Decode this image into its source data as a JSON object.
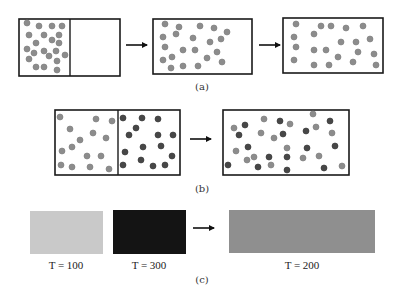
{
  "colors": {
    "border": "#1a1a1a",
    "dot_gray": "#8c8c8c",
    "dot_gray_stroke": "#7a7a7a",
    "dot_dark": "#474747",
    "dot_dark_stroke": "#333333",
    "arrow": "#111111",
    "rect_cold": "#c9c9c9",
    "rect_hot": "#141414",
    "rect_mixed": "#8f8f8f"
  },
  "dot_radius": 3,
  "panels": {
    "a": {
      "label": "(a)",
      "label_pos": [
        202,
        90
      ],
      "boxes": [
        {
          "name": "box-a-initial",
          "x": 19,
          "y": 19,
          "w": 101,
          "h": 57,
          "divider_x": 70,
          "gray_dots": [
            [
              27,
              23
            ],
            [
              39,
              26
            ],
            [
              52,
              26
            ],
            [
              62,
              26
            ],
            [
              29,
              35
            ],
            [
              44,
              35
            ],
            [
              59,
              35
            ],
            [
              36,
              43
            ],
            [
              52,
              40
            ],
            [
              59,
              43
            ],
            [
              27,
              49
            ],
            [
              34,
              53
            ],
            [
              44,
              51
            ],
            [
              56,
              51
            ],
            [
              65,
              55
            ],
            [
              29,
              59
            ],
            [
              49,
              56
            ],
            [
              57,
              61
            ],
            [
              36,
              67
            ],
            [
              44,
              67
            ],
            [
              57,
              70
            ]
          ],
          "dark_dots": []
        },
        {
          "name": "box-a-expanding",
          "x": 153,
          "y": 19,
          "w": 99,
          "h": 55,
          "divider_x": null,
          "gray_dots": [
            [
              165,
              24
            ],
            [
              179,
              27
            ],
            [
              200,
              26
            ],
            [
              214,
              28
            ],
            [
              227,
              32
            ],
            [
              163,
              37
            ],
            [
              176,
              34
            ],
            [
              193,
              38
            ],
            [
              210,
              42
            ],
            [
              221,
              39
            ],
            [
              165,
              47
            ],
            [
              183,
              50
            ],
            [
              195,
              50
            ],
            [
              217,
              52
            ],
            [
              163,
              60
            ],
            [
              172,
              57
            ],
            [
              207,
              58
            ],
            [
              222,
              62
            ],
            [
              171,
              68
            ],
            [
              183,
              66
            ],
            [
              198,
              66
            ]
          ],
          "dark_dots": []
        },
        {
          "name": "box-a-final",
          "x": 283,
          "y": 18,
          "w": 100,
          "h": 55,
          "divider_x": null,
          "gray_dots": [
            [
              296,
              24
            ],
            [
              321,
              26
            ],
            [
              331,
              26
            ],
            [
              346,
              28
            ],
            [
              363,
              26
            ],
            [
              294,
              37
            ],
            [
              314,
              34
            ],
            [
              341,
              42
            ],
            [
              356,
              42
            ],
            [
              370,
              39
            ],
            [
              296,
              47
            ],
            [
              314,
              50
            ],
            [
              326,
              50
            ],
            [
              358,
              52
            ],
            [
              294,
              60
            ],
            [
              338,
              57
            ],
            [
              353,
              62
            ],
            [
              374,
              54
            ],
            [
              314,
              65
            ],
            [
              329,
              65
            ],
            [
              376,
              65
            ]
          ],
          "dark_dots": []
        }
      ],
      "arrows": [
        {
          "x1": 126,
          "x2": 147,
          "y": 45
        },
        {
          "x1": 259,
          "x2": 280,
          "y": 45
        }
      ]
    },
    "b": {
      "label": "(b)",
      "label_pos": [
        202,
        192
      ],
      "boxes": [
        {
          "name": "box-b-initial",
          "x": 55,
          "y": 110,
          "w": 125,
          "h": 65,
          "divider_x": 118,
          "gray_dots": [
            [
              60,
              117
            ],
            [
              96,
              119
            ],
            [
              112,
              121
            ],
            [
              70,
              129
            ],
            [
              93,
              133
            ],
            [
              80,
              140
            ],
            [
              106,
              138
            ],
            [
              62,
              151
            ],
            [
              72,
              147
            ],
            [
              87,
              156
            ],
            [
              101,
              156
            ],
            [
              61,
              165
            ],
            [
              72,
              167
            ],
            [
              90,
              167
            ],
            [
              109,
              169
            ]
          ],
          "dark_dots": [
            [
              123,
              118
            ],
            [
              142,
              118
            ],
            [
              158,
              119
            ],
            [
              136,
              128
            ],
            [
              129,
              135
            ],
            [
              158,
              135
            ],
            [
              173,
              135
            ],
            [
              143,
              147
            ],
            [
              161,
              146
            ],
            [
              125,
              152
            ],
            [
              141,
              160
            ],
            [
              172,
              156
            ],
            [
              123,
              165
            ],
            [
              153,
              166
            ],
            [
              165,
              165
            ]
          ]
        },
        {
          "name": "box-b-mixed",
          "x": 223,
          "y": 110,
          "w": 126,
          "h": 65,
          "divider_x": null,
          "gray_dots": [
            [
              234,
              128
            ],
            [
              264,
              119
            ],
            [
              261,
              133
            ],
            [
              290,
              124
            ],
            [
              313,
              114
            ],
            [
              316,
              127
            ],
            [
              332,
              133
            ],
            [
              236,
              151
            ],
            [
              247,
              160
            ],
            [
              254,
              157
            ],
            [
              287,
              148
            ],
            [
              271,
              165
            ],
            [
              303,
              158
            ],
            [
              319,
              156
            ],
            [
              342,
              166
            ],
            [
              274,
              138
            ]
          ],
          "dark_dots": [
            [
              245,
              125
            ],
            [
              239,
              135
            ],
            [
              280,
              121
            ],
            [
              283,
              134
            ],
            [
              306,
              131
            ],
            [
              330,
              121
            ],
            [
              248,
              147
            ],
            [
              269,
              157
            ],
            [
              287,
              157
            ],
            [
              307,
              148
            ],
            [
              335,
              146
            ],
            [
              228,
              165
            ],
            [
              258,
              167
            ],
            [
              287,
              170
            ],
            [
              324,
              168
            ]
          ]
        }
      ],
      "arrows": [
        {
          "x1": 190,
          "x2": 211,
          "y": 139
        }
      ]
    },
    "c": {
      "label": "(c)",
      "label_pos": [
        202,
        283
      ],
      "rects": [
        {
          "name": "rect-cold",
          "x": 30,
          "y": 211,
          "w": 73,
          "h": 43,
          "fill_key": "rect_cold",
          "temp_label": "T = 100",
          "label_x": 66,
          "label_y": 269
        },
        {
          "name": "rect-hot",
          "x": 113,
          "y": 210,
          "w": 73,
          "h": 44,
          "fill_key": "rect_hot",
          "temp_label": "T = 300",
          "label_x": 149,
          "label_y": 269
        },
        {
          "name": "rect-mixed",
          "x": 229,
          "y": 210,
          "w": 146,
          "h": 43,
          "fill_key": "rect_mixed",
          "temp_label": "T = 200",
          "label_x": 302,
          "label_y": 269
        }
      ],
      "arrows": [
        {
          "x1": 193,
          "x2": 214,
          "y": 228
        }
      ]
    }
  }
}
